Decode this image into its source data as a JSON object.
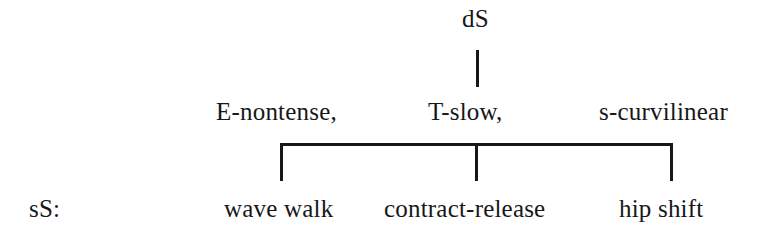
{
  "diagram": {
    "type": "linguistic-derivation-tree",
    "root": {
      "label": "dS"
    },
    "features": [
      {
        "label": "E-nontense,"
      },
      {
        "label": "T-slow,"
      },
      {
        "label": "s-curvilinear"
      }
    ],
    "surface_row_label": "sS:",
    "surface_forms": [
      {
        "label": "wave walk"
      },
      {
        "label": "contract-release"
      },
      {
        "label": "hip shift"
      }
    ],
    "colors": {
      "ink": "#17171a",
      "background": "#ffffff"
    }
  }
}
